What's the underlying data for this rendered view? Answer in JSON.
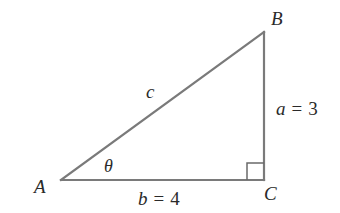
{
  "diagram": {
    "type": "right-triangle",
    "colors": {
      "edge": "#7a7a7a",
      "label": "#2a2a2a",
      "background": "#ffffff"
    },
    "vertices": {
      "A": {
        "label": "A",
        "x": 60,
        "y": 180
      },
      "B": {
        "label": "B",
        "x": 264,
        "y": 32
      },
      "C": {
        "label": "C",
        "x": 264,
        "y": 180
      }
    },
    "sides": {
      "hypotenuse": {
        "var": "c",
        "value_text": ""
      },
      "opposite": {
        "var": "a",
        "equals": "=",
        "value": "3"
      },
      "adjacent": {
        "var": "b",
        "equals": "=",
        "value": "4"
      }
    },
    "angle": {
      "symbol": "θ",
      "at_vertex": "A"
    },
    "right_angle_at": "C"
  }
}
